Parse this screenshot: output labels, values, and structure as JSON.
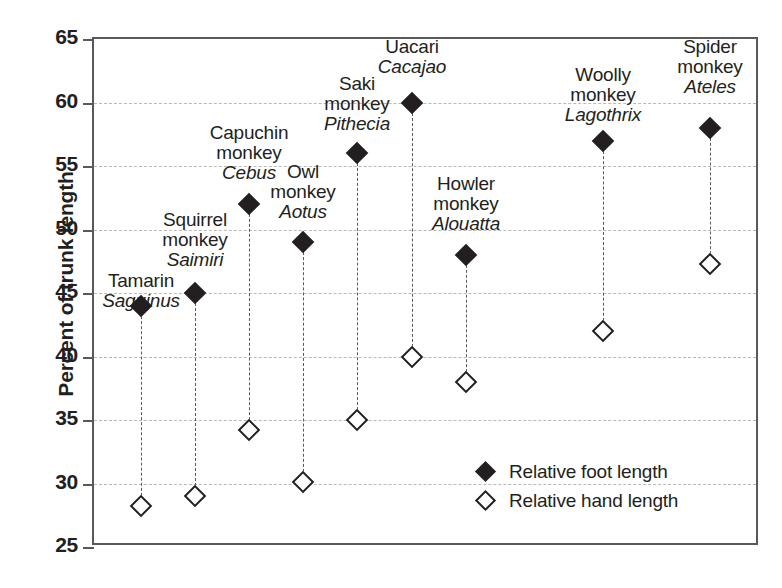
{
  "chart_data": {
    "type": "scatter",
    "title": "",
    "xlabel": "",
    "ylabel": "Percent of trunk length",
    "ylim": [
      25,
      65
    ],
    "yticks": [
      25,
      30,
      35,
      40,
      45,
      50,
      55,
      60,
      65
    ],
    "gridlines": [
      30,
      35,
      40,
      45,
      50,
      55,
      60
    ],
    "grid": true,
    "legend_position": "inside-bottom-right",
    "categories": [
      "Tamarin Saguinus",
      "Squirrel monkey Saimiri",
      "Capuchin monkey Cebus",
      "Owl monkey Aotus",
      "Saki monkey Pithecia",
      "Uacari Cacajao",
      "Howler monkey Alouatta",
      "Woolly monkey Lagothrix",
      "Spider monkey Ateles"
    ],
    "series": [
      {
        "name": "Relative foot length",
        "marker": "filled-diamond",
        "values": [
          44,
          45,
          52,
          49,
          56,
          60,
          48,
          57,
          58
        ]
      },
      {
        "name": "Relative hand length",
        "marker": "hollow-diamond",
        "values": [
          28.2,
          29,
          34.2,
          30.1,
          35,
          40,
          38,
          42,
          47.3
        ]
      }
    ],
    "points": [
      {
        "common_name_line1": "Tamarin",
        "common_name_line2": "",
        "genus": "Saguinus",
        "foot_length": 44,
        "hand_length": 28.2,
        "x_px": 139,
        "label_lines": [
          "Tamarin"
        ],
        "label_top": 269
      },
      {
        "common_name_line1": "Squirrel",
        "common_name_line2": "monkey",
        "genus": "Saimiri",
        "foot_length": 45,
        "hand_length": 29,
        "x_px": 193,
        "label_lines": [
          "Squirrel",
          "monkey"
        ],
        "label_top": 208
      },
      {
        "common_name_line1": "Capuchin",
        "common_name_line2": "monkey",
        "genus": "Cebus",
        "foot_length": 52,
        "hand_length": 34.2,
        "x_px": 247,
        "label_lines": [
          "Capuchin",
          "monkey"
        ],
        "label_top": 121
      },
      {
        "common_name_line1": "Owl",
        "common_name_line2": "monkey",
        "genus": "Aotus",
        "foot_length": 49,
        "hand_length": 30.1,
        "x_px": 301,
        "label_lines": [
          "Owl",
          "monkey"
        ],
        "label_top": 160
      },
      {
        "common_name_line1": "Saki",
        "common_name_line2": "monkey",
        "genus": "Pithecia",
        "foot_length": 56,
        "hand_length": 35,
        "x_px": 355,
        "label_lines": [
          "Saki",
          "monkey"
        ],
        "label_top": 72
      },
      {
        "common_name_line1": "Uacari",
        "common_name_line2": "",
        "genus": "Cacajao",
        "foot_length": 60,
        "hand_length": 40,
        "x_px": 410,
        "label_lines": [
          "Uacari"
        ],
        "label_top": 35
      },
      {
        "common_name_line1": "Howler",
        "common_name_line2": "monkey",
        "genus": "Alouatta",
        "foot_length": 48,
        "hand_length": 38,
        "x_px": 464,
        "label_lines": [
          "Howler",
          "monkey"
        ],
        "label_top": 172
      },
      {
        "common_name_line1": "Woolly",
        "common_name_line2": "monkey",
        "genus": "Lagothrix",
        "foot_length": 57,
        "hand_length": 42,
        "x_px": 601,
        "label_lines": [
          "Woolly",
          "monkey"
        ],
        "label_top": 63
      },
      {
        "common_name_line1": "Spider",
        "common_name_line2": "monkey",
        "genus": "Ateles",
        "foot_length": 58,
        "hand_length": 47.3,
        "x_px": 708,
        "label_lines": [
          "Spider",
          "monkey"
        ],
        "label_top": 35
      }
    ],
    "legend": [
      {
        "marker": "filled-diamond",
        "label": "Relative foot length"
      },
      {
        "marker": "hollow-diamond",
        "label": "Relative hand length"
      }
    ]
  },
  "axis": {
    "y_title": "Percent of trunk length",
    "tick_labels": [
      "65",
      "60",
      "55",
      "50",
      "45",
      "40",
      "35",
      "30",
      "25"
    ]
  },
  "legend": {
    "foot_label": "Relative foot length",
    "hand_label": "Relative hand length"
  },
  "colors": {
    "ink": "#231f20",
    "frame": "#58595b",
    "grid": "#b9b9bb",
    "background": "#ffffff"
  }
}
